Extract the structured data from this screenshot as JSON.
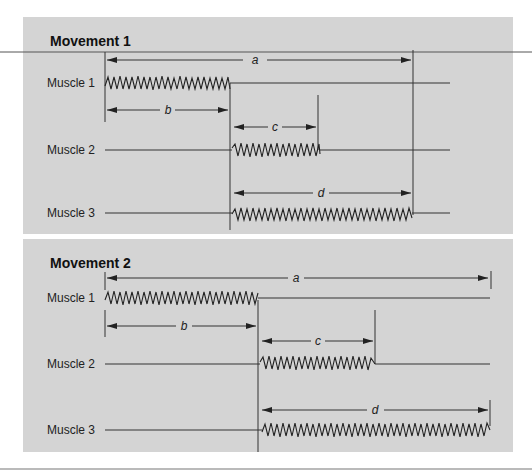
{
  "figure": {
    "colors": {
      "panel_bg": "#d4d4d4",
      "line": "#333333",
      "rule": "#555555"
    },
    "panels": [
      {
        "title": "Movement 1",
        "muscles": [
          {
            "label": "Muscle 1",
            "burst_start": 105,
            "burst_end": 230
          },
          {
            "label": "Muscle 2",
            "burst_start": 232,
            "burst_end": 320
          },
          {
            "label": "Muscle 3",
            "burst_start": 232,
            "burst_end": 412
          }
        ],
        "intervals": [
          {
            "label": "a",
            "description": "onset Muscle 1 to offset Muscle 3"
          },
          {
            "label": "b",
            "description": "duration Muscle 1"
          },
          {
            "label": "c",
            "description": "duration Muscle 2"
          },
          {
            "label": "d",
            "description": "duration Muscle 3"
          }
        ]
      },
      {
        "title": "Movement 2",
        "muscles": [
          {
            "label": "Muscle 1",
            "burst_start": 105,
            "burst_end": 258
          },
          {
            "label": "Muscle 2",
            "burst_start": 262,
            "burst_end": 375
          },
          {
            "label": "Muscle 3",
            "burst_start": 262,
            "burst_end": 490
          }
        ],
        "intervals": [
          {
            "label": "a"
          },
          {
            "label": "b"
          },
          {
            "label": "c"
          },
          {
            "label": "d"
          }
        ]
      }
    ]
  }
}
